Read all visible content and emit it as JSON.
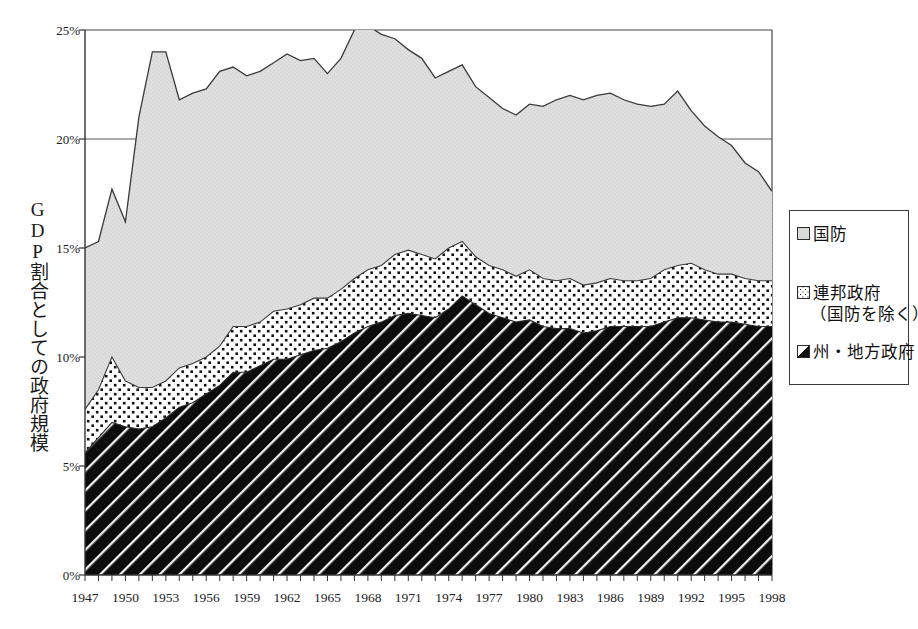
{
  "chart_data": {
    "type": "area",
    "title": "",
    "subtitle": "",
    "xlabel": "",
    "ylabel": "GDP割合としての政府規模",
    "xlim": [
      1947,
      1998
    ],
    "ylim": [
      0,
      25
    ],
    "yunit": "%",
    "stacked": true,
    "grid": true,
    "gridlines_y": [
      20,
      25
    ],
    "legend_position": "right",
    "ytick_labels": [
      "0%",
      "5%",
      "10%",
      "15%",
      "20%",
      "25%"
    ],
    "ytick_values": [
      0,
      5,
      10,
      15,
      20,
      25
    ],
    "xtick_labels": [
      "1947",
      "1950",
      "1953",
      "1956",
      "1959",
      "1962",
      "1965",
      "1968",
      "1971",
      "1974",
      "1977",
      "1980",
      "1983",
      "1986",
      "1989",
      "1992",
      "1995",
      "1998"
    ],
    "xtick_values": [
      1947,
      1950,
      1953,
      1956,
      1959,
      1962,
      1965,
      1968,
      1971,
      1974,
      1977,
      1980,
      1983,
      1986,
      1989,
      1992,
      1995,
      1998
    ],
    "x": [
      1947,
      1948,
      1949,
      1950,
      1951,
      1952,
      1953,
      1954,
      1955,
      1956,
      1957,
      1958,
      1959,
      1960,
      1961,
      1962,
      1963,
      1964,
      1965,
      1966,
      1967,
      1968,
      1969,
      1970,
      1971,
      1972,
      1973,
      1974,
      1975,
      1976,
      1977,
      1978,
      1979,
      1980,
      1981,
      1982,
      1983,
      1984,
      1985,
      1986,
      1987,
      1988,
      1989,
      1990,
      1991,
      1992,
      1993,
      1994,
      1995,
      1996,
      1997,
      1998
    ],
    "series": [
      {
        "name": "州・地方政府",
        "pattern": "diagonal-hatch-black",
        "color": "#111111",
        "values": [
          5.6,
          6.3,
          7.0,
          6.8,
          6.7,
          6.8,
          7.2,
          7.7,
          7.9,
          8.3,
          8.7,
          9.3,
          9.3,
          9.6,
          9.9,
          9.9,
          10.1,
          10.3,
          10.4,
          10.7,
          11.1,
          11.4,
          11.6,
          11.9,
          12.0,
          11.9,
          11.8,
          12.2,
          12.8,
          12.4,
          12.0,
          11.8,
          11.6,
          11.7,
          11.4,
          11.3,
          11.3,
          11.1,
          11.2,
          11.4,
          11.4,
          11.4,
          11.4,
          11.6,
          11.8,
          11.8,
          11.7,
          11.6,
          11.6,
          11.5,
          11.4,
          11.4
        ]
      },
      {
        "name": "連邦政府（国防を除く）",
        "pattern": "dotted",
        "color": "#ffffff",
        "values": [
          2.0,
          2.2,
          3.0,
          2.1,
          1.9,
          1.8,
          1.7,
          1.8,
          1.8,
          1.7,
          1.8,
          2.1,
          2.1,
          2.0,
          2.2,
          2.3,
          2.3,
          2.4,
          2.3,
          2.4,
          2.5,
          2.6,
          2.6,
          2.8,
          2.9,
          2.8,
          2.7,
          2.8,
          2.5,
          2.2,
          2.2,
          2.2,
          2.1,
          2.3,
          2.2,
          2.2,
          2.3,
          2.2,
          2.2,
          2.2,
          2.1,
          2.1,
          2.2,
          2.4,
          2.4,
          2.5,
          2.3,
          2.2,
          2.2,
          2.1,
          2.1,
          2.1
        ]
      },
      {
        "name": "国防",
        "pattern": "light-gray-fill",
        "color": "#d9d9d9",
        "values": [
          7.4,
          6.8,
          7.7,
          7.3,
          12.4,
          15.4,
          15.1,
          12.3,
          12.4,
          12.3,
          12.6,
          11.9,
          11.5,
          11.5,
          11.4,
          11.7,
          11.2,
          11.0,
          10.3,
          10.6,
          11.4,
          11.2,
          10.6,
          9.9,
          9.2,
          9.0,
          8.3,
          8.1,
          8.1,
          7.8,
          7.7,
          7.4,
          7.4,
          7.6,
          7.9,
          8.3,
          8.4,
          8.5,
          8.6,
          8.5,
          8.3,
          8.1,
          7.9,
          7.6,
          8.0,
          7.0,
          6.6,
          6.3,
          5.9,
          5.3,
          5.0,
          4.1
        ]
      }
    ],
    "totals": [
      15.0,
      15.3,
      17.7,
      16.2,
      21.0,
      24.0,
      24.0,
      21.8,
      22.1,
      22.3,
      23.1,
      23.3,
      22.9,
      23.1,
      23.5,
      23.9,
      23.6,
      23.7,
      23.0,
      23.7,
      25.0,
      25.2,
      24.8,
      24.6,
      24.1,
      23.7,
      22.8,
      23.1,
      23.4,
      22.4,
      21.9,
      21.4,
      21.1,
      21.6,
      21.5,
      21.8,
      22.0,
      21.8,
      22.0,
      22.1,
      21.8,
      21.6,
      21.5,
      21.6,
      22.2,
      21.3,
      20.6,
      20.1,
      19.7,
      18.9,
      18.5,
      17.6
    ]
  },
  "legend": {
    "items": [
      {
        "key": "defense",
        "label": "国防",
        "label_line2": ""
      },
      {
        "key": "federal",
        "label": "連邦政府",
        "label_line2": "（国防を除く）"
      },
      {
        "key": "state",
        "label": "州・地方政府",
        "label_line2": ""
      }
    ]
  },
  "axes": {
    "y_title": "GDP割合としての政府規模",
    "y_ticks": [
      "25%",
      "20%",
      "15%",
      "10%",
      "5%",
      "0%"
    ],
    "x_ticks": [
      "1947",
      "1950",
      "1953",
      "1956",
      "1959",
      "1962",
      "1965",
      "1968",
      "1971",
      "1974",
      "1977",
      "1980",
      "1983",
      "1986",
      "1989",
      "1992",
      "1995",
      "1998"
    ]
  },
  "colors": {
    "defense_fill": "#d9d9d9",
    "federal_fill": "#ffffff",
    "state_fill": "#111111",
    "axis": "#333333",
    "gridline": "#555555",
    "background": "#ffffff"
  }
}
